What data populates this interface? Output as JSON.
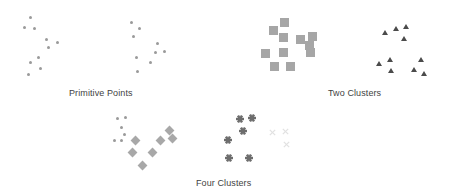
{
  "figure": {
    "background": "#ffffff",
    "width": 450,
    "height": 195
  },
  "captions": {
    "primitive_points": "Primitive Points",
    "two_clusters": "Two Clusters",
    "four_clusters": "Four  Clusters"
  },
  "colors": {
    "dot": "#9a9a9a",
    "square": "#a6a6a6",
    "triangle": "#4b4b4b",
    "diamond": "#a8a8a8",
    "star": "#6d6d6d",
    "ex": "#e2e2e2",
    "caption_text": "#3f3f3f"
  },
  "chart_data": {
    "type": "scatter",
    "title": "",
    "xlabel": "",
    "ylabel": "",
    "grid": false,
    "legend": "none",
    "axis_visible": false,
    "xlim": [
      0,
      450
    ],
    "ylim": [
      0,
      195
    ],
    "annotations": [
      "Primitive Points",
      "Two Clusters",
      "Four  Clusters"
    ],
    "panels": [
      {
        "name": "primitive-points",
        "caption": "Primitive Points",
        "caption_x": 69,
        "caption_y": 88,
        "series": [
          {
            "name": "points-group-a",
            "marker": "circle",
            "color": "#9a9a9a",
            "size": 3,
            "points": [
              [
                30,
                17
              ],
              [
                24,
                27
              ],
              [
                34,
                28
              ],
              [
                46,
                39
              ],
              [
                57,
                42
              ],
              [
                48,
                47
              ],
              [
                38,
                57
              ],
              [
                30,
                62
              ],
              [
                40,
                68
              ],
              [
                28,
                74
              ]
            ]
          },
          {
            "name": "points-group-b",
            "marker": "circle",
            "color": "#9a9a9a",
            "size": 3,
            "points": [
              [
                131,
                22
              ],
              [
                139,
                28
              ],
              [
                133,
                36
              ],
              [
                157,
                43
              ],
              [
                155,
                52
              ],
              [
                164,
                51
              ],
              [
                136,
                57
              ],
              [
                150,
                62
              ],
              [
                137,
                71
              ]
            ]
          }
        ]
      },
      {
        "name": "two-clusters",
        "caption": "Two Clusters",
        "caption_x": 328,
        "caption_y": 88,
        "series": [
          {
            "name": "squares-cluster",
            "marker": "square",
            "color": "#a6a6a6",
            "size": 9,
            "points": [
              [
                284,
                22
              ],
              [
                273,
                30
              ],
              [
                283,
                37
              ],
              [
                300,
                39
              ],
              [
                312,
                36
              ],
              [
                309,
                45
              ],
              [
                265,
                53
              ],
              [
                283,
                52
              ],
              [
                310,
                52
              ],
              [
                274,
                66
              ],
              [
                290,
                66
              ]
            ]
          },
          {
            "name": "triangles-cluster",
            "marker": "triangle",
            "color": "#4b4b4b",
            "size": 6,
            "points": [
              [
                396,
                29
              ],
              [
                406,
                27
              ],
              [
                404,
                39
              ],
              [
                385,
                33
              ],
              [
                379,
                64
              ],
              [
                390,
                60
              ],
              [
                391,
                71
              ],
              [
                421,
                60
              ],
              [
                414,
                70
              ],
              [
                424,
                74
              ]
            ]
          }
        ]
      },
      {
        "name": "four-clusters",
        "caption": "Four  Clusters",
        "caption_x": 196,
        "caption_y": 178,
        "series": [
          {
            "name": "dots-cluster",
            "marker": "circle",
            "color": "#9a9a9a",
            "size": 3,
            "points": [
              [
                117,
                118
              ],
              [
                125,
                117
              ],
              [
                121,
                127
              ],
              [
                124,
                134
              ],
              [
                114,
                140
              ],
              [
                121,
                140
              ]
            ]
          },
          {
            "name": "diamonds-cluster",
            "marker": "diamond",
            "color": "#a8a8a8",
            "size": 7,
            "points": [
              [
                169,
                130
              ],
              [
                135,
                140
              ],
              [
                160,
                140
              ],
              [
                172,
                138
              ],
              [
                132,
                152
              ],
              [
                152,
                152
              ],
              [
                142,
                165
              ]
            ]
          },
          {
            "name": "stars-cluster",
            "marker": "star",
            "color": "#6d6d6d",
            "size": 8,
            "points": [
              [
                240,
                119
              ],
              [
                252,
                118
              ],
              [
                243,
                131
              ],
              [
                228,
                140
              ],
              [
                229,
                158
              ],
              [
                249,
                158
              ]
            ]
          },
          {
            "name": "x-cluster",
            "marker": "x",
            "color": "#e2e2e2",
            "size": 7,
            "points": [
              [
                272,
                132
              ],
              [
                285,
                131
              ],
              [
                286,
                144
              ]
            ]
          }
        ]
      }
    ]
  }
}
